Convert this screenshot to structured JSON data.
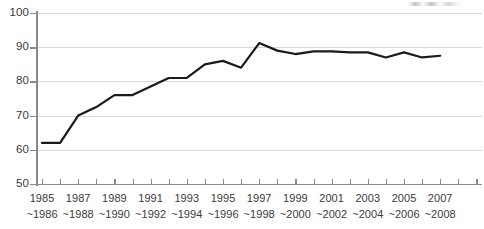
{
  "chart_data": {
    "type": "line",
    "title": "",
    "xlabel": "",
    "ylabel": "",
    "ylim": [
      50,
      100
    ],
    "ytick_values": [
      50,
      60,
      70,
      80,
      90,
      100
    ],
    "ytick_labels": [
      "50",
      "60",
      "70",
      "80",
      "90",
      "100"
    ],
    "grid": true,
    "legend": false,
    "xtick_labels": [
      {
        "line1": "1985",
        "line2": "~1986"
      },
      {
        "line1": "1987",
        "line2": "~1988"
      },
      {
        "line1": "1989",
        "line2": "~1990"
      },
      {
        "line1": "1991",
        "line2": "~1992"
      },
      {
        "line1": "1993",
        "line2": "~1994"
      },
      {
        "line1": "1995",
        "line2": "~1996"
      },
      {
        "line1": "1997",
        "line2": "~1998"
      },
      {
        "line1": "1999",
        "line2": "~2000"
      },
      {
        "line1": "2001",
        "line2": "~2002"
      },
      {
        "line1": "2003",
        "line2": "~2004"
      },
      {
        "line1": "2005",
        "line2": "~2006"
      },
      {
        "line1": "2007",
        "line2": "~2008"
      }
    ],
    "x": [
      "1985~1986",
      "1986~1987",
      "1987~1988",
      "1988~1989",
      "1989~1990",
      "1990~1991",
      "1991~1992",
      "1992~1993",
      "1993~1994",
      "1994~1995",
      "1995~1996",
      "1996~1997",
      "1997~1998",
      "1998~1999",
      "1999~2000",
      "2000~2001",
      "2001~2002",
      "2002~2003",
      "2003~2004",
      "2004~2005",
      "2005~2006",
      "2006~2007",
      "2007~2008"
    ],
    "values": [
      62.0,
      62.0,
      70.0,
      72.5,
      76.0,
      76.0,
      78.5,
      81.0,
      81.0,
      85.0,
      86.0,
      84.0,
      91.2,
      89.0,
      88.0,
      88.8,
      88.8,
      88.5,
      88.5,
      87.0,
      88.5,
      87.0,
      87.5
    ],
    "series_color": "#1a1a1a",
    "grid_color": "#d9d9dc",
    "axis_color": "#8a8a8e",
    "line_width": 2.2
  }
}
